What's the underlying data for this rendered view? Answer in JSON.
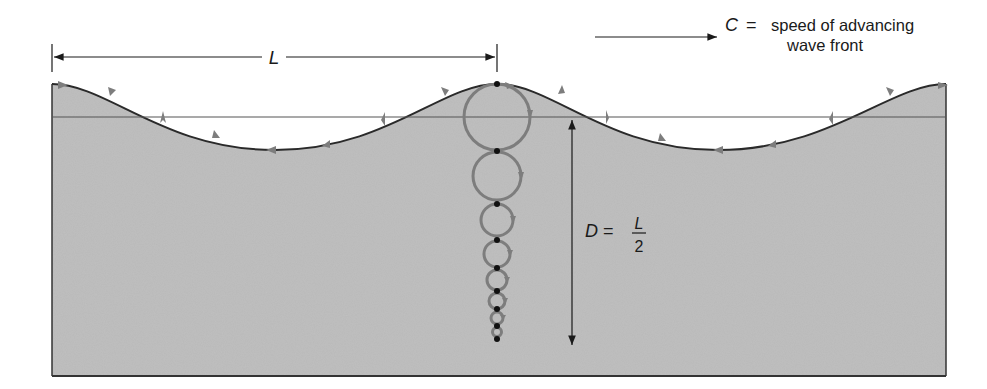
{
  "labels": {
    "wavelength": "L",
    "speed_symbol": "C",
    "speed_eq": "=",
    "speed_text_line1": "speed of advancing",
    "speed_text_line2": "wave front",
    "depth_symbol": "D",
    "depth_eq": "=",
    "depth_numerator": "L",
    "depth_denominator": "2"
  },
  "colors": {
    "water": "#b9b9b9",
    "water_edge": "#2a2a2a",
    "orbit": "#7d7d7d",
    "dot": "#111111",
    "still_water_line": "#555555",
    "text": "#1a1a1a"
  },
  "geometry": {
    "box": {
      "left": 52,
      "right": 946,
      "bottom": 376
    },
    "still_water_y": 117,
    "crest_y": 84,
    "trough_y": 150,
    "wavelength_px": 446,
    "orbit_column_x": 497,
    "orbits": [
      {
        "cy": 117,
        "r": 33
      },
      {
        "cy": 176,
        "r": 24
      },
      {
        "cy": 220,
        "r": 16
      },
      {
        "cy": 254,
        "r": 13
      },
      {
        "cy": 280,
        "r": 10
      },
      {
        "cy": 301,
        "r": 8
      },
      {
        "cy": 318,
        "r": 6
      },
      {
        "cy": 332,
        "r": 4.5
      }
    ],
    "particle_dots_y": [
      84,
      151,
      204,
      240,
      268,
      291,
      309,
      326,
      339
    ]
  }
}
